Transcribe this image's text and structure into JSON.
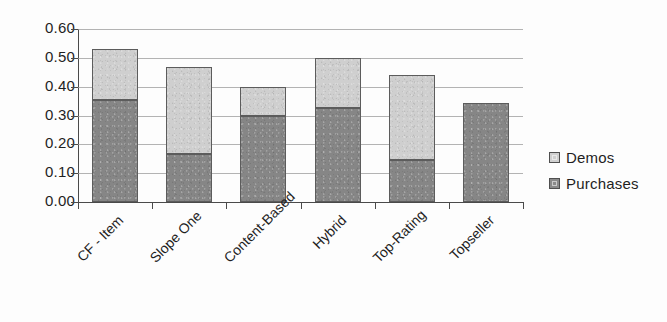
{
  "chart_data": {
    "type": "bar",
    "subtype": "stacked-bar",
    "title": "",
    "xlabel": "",
    "ylabel": "",
    "ylim": [
      0.0,
      0.6
    ],
    "ytick_labels": [
      "0.60",
      "0.50",
      "0.40",
      "0.30",
      "0.20",
      "0.10",
      "0.00"
    ],
    "ytick_values": [
      0.6,
      0.5,
      0.4,
      0.3,
      0.2,
      0.1,
      0.0
    ],
    "grid": true,
    "grid_axis": "y",
    "legend_position": "right",
    "categories": [
      "CF - Item",
      "Slope One",
      "Content-Based",
      "Hybrid",
      "Top-Rating",
      "Topseller"
    ],
    "series": [
      {
        "name": "Purchases",
        "color": "#868686",
        "values": [
          0.355,
          0.165,
          0.3,
          0.325,
          0.145,
          0.345
        ]
      },
      {
        "name": "Demos",
        "color": "#cfcfcf",
        "values": [
          0.175,
          0.305,
          0.1,
          0.175,
          0.295,
          0.0
        ]
      }
    ],
    "totals": [
      0.53,
      0.47,
      0.4,
      0.5,
      0.44,
      0.345
    ]
  },
  "legend": {
    "items": [
      {
        "label": "Demos",
        "swatch": "light"
      },
      {
        "label": "Purchases",
        "swatch": "dark"
      }
    ]
  }
}
